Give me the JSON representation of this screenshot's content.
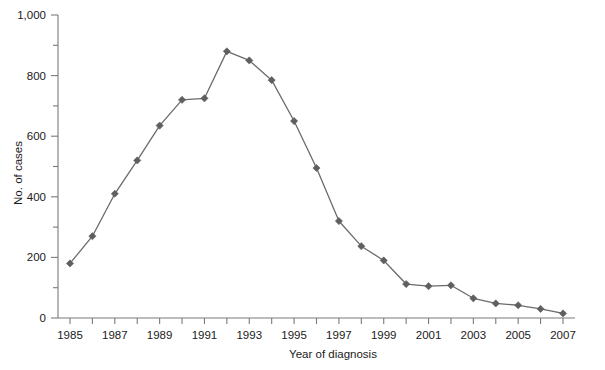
{
  "chart_data": {
    "type": "line",
    "title": "",
    "subtitle": "",
    "xlabel": "Year of diagnosis",
    "ylabel": "No. of cases",
    "x": [
      1985,
      1986,
      1987,
      1988,
      1989,
      1990,
      1991,
      1992,
      1993,
      1994,
      1995,
      1996,
      1997,
      1998,
      1999,
      2000,
      2001,
      2002,
      2003,
      2004,
      2005,
      2006,
      2007
    ],
    "values": [
      180,
      270,
      410,
      520,
      635,
      720,
      725,
      880,
      850,
      785,
      650,
      495,
      320,
      237,
      190,
      112,
      105,
      108,
      65,
      48,
      42,
      30,
      15
    ],
    "series": [
      {
        "name": "No. of cases",
        "values": [
          180,
          270,
          410,
          520,
          635,
          720,
          725,
          880,
          850,
          785,
          650,
          495,
          320,
          237,
          190,
          112,
          105,
          108,
          65,
          48,
          42,
          30,
          15
        ],
        "color": "#6b6b6b",
        "marker": "diamond"
      }
    ],
    "xlim": [
      1985,
      2007
    ],
    "ylim": [
      0,
      1000
    ],
    "x_tick_values": [
      1985,
      1986,
      1987,
      1988,
      1989,
      1990,
      1991,
      1992,
      1993,
      1994,
      1995,
      1996,
      1997,
      1998,
      1999,
      2000,
      2001,
      2002,
      2003,
      2004,
      2005,
      2006,
      2007
    ],
    "x_tick_labels": [
      "1985",
      "",
      "1987",
      "",
      "1989",
      "",
      "1991",
      "",
      "1993",
      "",
      "1995",
      "",
      "1997",
      "",
      "1999",
      "",
      "2001",
      "",
      "2003",
      "",
      "2005",
      "",
      "2007"
    ],
    "y_major_ticks": [
      0,
      200,
      400,
      600,
      800,
      1000
    ],
    "y_major_tick_labels": [
      "0",
      "200",
      "400",
      "600",
      "800",
      "1,000"
    ],
    "y_minor_ticks": [
      100,
      300,
      500,
      700,
      900
    ],
    "grid": false,
    "legend": false,
    "legend_position": "none"
  },
  "axis_labels": {
    "x_title": "Year of diagnosis",
    "y_title": "No. of cases"
  },
  "colors": {
    "series": "#6b6b6b",
    "marker": "#5f5f5f",
    "axis": "#7a7a7a",
    "text": "#1a1a1a",
    "background": "#ffffff"
  }
}
